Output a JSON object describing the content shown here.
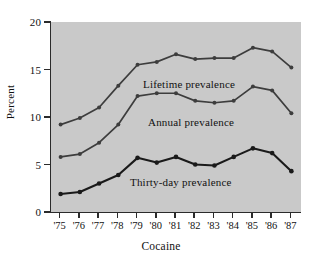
{
  "chart_data": {
    "type": "line",
    "title": "",
    "xlabel": "Cocaine",
    "ylabel": "Percent",
    "x": [
      "'75",
      "'76",
      "'77",
      "'78",
      "'79",
      "'80",
      "'81",
      "'82",
      "'83",
      "'84",
      "'85",
      "'86",
      "'87"
    ],
    "xtick_labels": [
      "'75",
      "'76",
      "'77",
      "'78",
      "'79",
      "'80",
      "'81",
      "'82",
      "'83",
      "'84",
      "'85",
      "'86",
      "'87"
    ],
    "ytick_labels": [
      "0",
      "5",
      "10",
      "15",
      "20"
    ],
    "ytick_values": [
      0,
      5,
      10,
      15,
      20
    ],
    "ylim": [
      0,
      20
    ],
    "grid": false,
    "legend_position": "inline-annotations",
    "series": [
      {
        "name": "Lifetime prevalence",
        "color": "#3d3d3d",
        "values": [
          9.2,
          9.9,
          11.0,
          13.3,
          15.5,
          15.8,
          16.6,
          16.1,
          16.2,
          16.2,
          17.3,
          16.9,
          15.2
        ]
      },
      {
        "name": "Annual prevalence",
        "color": "#3d3d3d",
        "values": [
          5.8,
          6.1,
          7.3,
          9.2,
          12.2,
          12.5,
          12.5,
          11.7,
          11.5,
          11.7,
          13.2,
          12.8,
          10.4
        ]
      },
      {
        "name": "Thirty-day prevalence",
        "color": "#1a1a1a",
        "values": [
          1.9,
          2.1,
          3.0,
          3.9,
          5.7,
          5.2,
          5.8,
          5.0,
          4.9,
          5.8,
          6.7,
          6.2,
          4.3
        ]
      }
    ],
    "annotations": [
      {
        "text": "Lifetime prevalence",
        "series": "Lifetime prevalence"
      },
      {
        "text": "Annual prevalence",
        "series": "Annual prevalence"
      },
      {
        "text": "Thirty-day prevalence",
        "series": "Thirty-day prevalence"
      }
    ]
  },
  "figure": {
    "background": "#ffffff",
    "plot_background": "#c9c9c9",
    "axis_color": "#2b2b2b"
  }
}
